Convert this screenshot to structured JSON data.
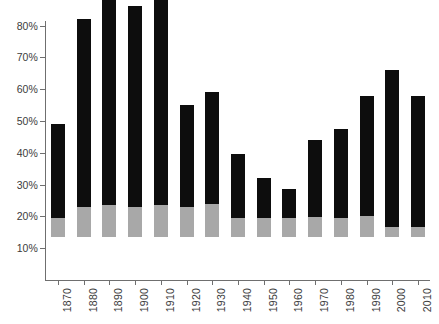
{
  "chart_data": {
    "type": "bar",
    "title": "",
    "subtitle": "",
    "xlabel": "",
    "ylabel": "",
    "grid": false,
    "legend_position": "none",
    "stacked": true,
    "ylim": [
      0,
      88
    ],
    "y_ticks": [
      10,
      20,
      30,
      40,
      50,
      60,
      70,
      80
    ],
    "y_tick_labels": [
      "10%",
      "20%",
      "30%",
      "40%",
      "50%",
      "60%",
      "70%",
      "80%"
    ],
    "categories": [
      "1870",
      "1880",
      "1890",
      "1900",
      "1910",
      "1920",
      "1930",
      "1940",
      "1950",
      "1960",
      "1970",
      "1980",
      "1990",
      "2000",
      "2010"
    ],
    "series": [
      {
        "name": "lower-segment",
        "color": "#a8a8a8",
        "values": [
          6.0,
          9.5,
          10.0,
          9.5,
          10.2,
          9.3,
          10.3,
          6.0,
          6.0,
          6.0,
          6.3,
          6.0,
          6.5,
          3.0,
          3.0
        ]
      },
      {
        "name": "upper-segment",
        "color": "#0d0d0d",
        "values": [
          29.5,
          59.0,
          70.5,
          63.0,
          64.8,
          32.2,
          35.2,
          20.0,
          12.5,
          9.0,
          24.2,
          28.0,
          38.0,
          49.5,
          41.5
        ]
      }
    ],
    "totals": [
      35.5,
      68.5,
      80.5,
      72.5,
      75.0,
      41.5,
      45.5,
      26.0,
      18.5,
      15.0,
      30.5,
      34.0,
      44.5,
      52.5,
      44.5
    ],
    "colors": {
      "upper": "#0d0d0d",
      "lower": "#a8a8a8",
      "axis": "#6f6f6f",
      "text": "#3b3b3b",
      "background": "#ffffff"
    }
  }
}
